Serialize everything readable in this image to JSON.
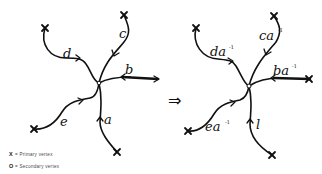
{
  "diagram": {
    "left_graph": {
      "center_vertex": "secondary",
      "edges": [
        {
          "label": "a",
          "endpoint": "primary-vertex"
        },
        {
          "label": "b",
          "endpoint": "primary-vertex"
        },
        {
          "label": "c",
          "endpoint": "primary-vertex"
        },
        {
          "label": "d",
          "endpoint": "primary-vertex"
        },
        {
          "label": "e",
          "endpoint": "primary-vertex"
        }
      ]
    },
    "implies_symbol": "⇒",
    "right_graph": {
      "center_vertex": "secondary",
      "edges": [
        {
          "label": "l",
          "sup": ""
        },
        {
          "label": "ba",
          "sup": "-1"
        },
        {
          "label": "ca",
          "sup": "-1"
        },
        {
          "label": "da",
          "sup": "-1"
        },
        {
          "label": "ea",
          "sup": "-1"
        }
      ]
    },
    "legend": [
      {
        "symbol": "X",
        "text": "= Primary vertex"
      },
      {
        "symbol": "O",
        "text": "= Secondary vertex"
      }
    ]
  }
}
